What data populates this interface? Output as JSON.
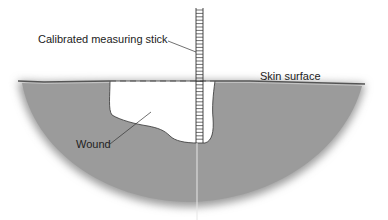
{
  "diagram": {
    "labels": {
      "stick": "Calibrated measuring stick",
      "skin": "Skin surface",
      "wound": "Wound"
    },
    "colors": {
      "tissue": "#9b9b9b",
      "skin_line": "#555555",
      "wound_fill": "#ffffff",
      "outline": "#333333"
    }
  }
}
